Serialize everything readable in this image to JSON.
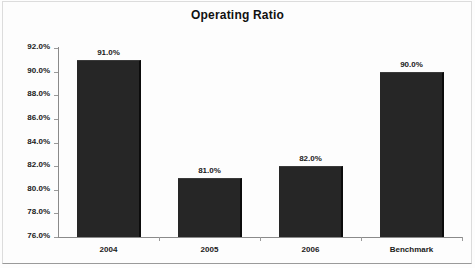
{
  "chart_data": {
    "type": "bar",
    "title": "Operating Ratio",
    "xlabel": "",
    "ylabel": "",
    "categories": [
      "2004",
      "2005",
      "2006",
      "Benchmark"
    ],
    "values": [
      91.0,
      81.0,
      82.0,
      90.0
    ],
    "value_labels": [
      "91.0%",
      "81.0%",
      "82.0%",
      "90.0%"
    ],
    "ylim": [
      76.0,
      92.0
    ],
    "ytick_values": [
      92.0,
      90.0,
      88.0,
      86.0,
      84.0,
      82.0,
      80.0,
      78.0,
      76.0
    ],
    "ytick_labels": [
      "92.0%",
      "90.0%",
      "88.0%",
      "86.0%",
      "84.0%",
      "82.0%",
      "80.0%",
      "78.0%",
      "76.0%"
    ],
    "grid": false,
    "legend": false,
    "legend_position": "none",
    "series": [
      {
        "name": "Operating Ratio",
        "values": [
          91.0,
          81.0,
          82.0,
          90.0
        ],
        "color": "#262626"
      }
    ]
  },
  "colors": {
    "bar": "#262626",
    "bar_edge": "#0c0c0c",
    "axis": "#8a8a8a",
    "text": "#1a1a1a",
    "background": "#fdfdfd",
    "frame": "#dcdcdc"
  }
}
